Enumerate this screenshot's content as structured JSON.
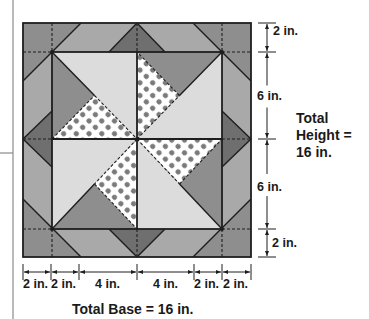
{
  "diagram": {
    "colors": {
      "light": "#dcdcdc",
      "medium": "#a9a9a9",
      "mediumDark": "#8e8e8e",
      "dark": "#6f6f6f",
      "dotBg": "#ffffff",
      "dot": "#7a7a7a",
      "line": "#1e1e1e",
      "text": "#1a1a1a"
    },
    "geometry": {
      "outer": {
        "x0": 23,
        "y0": 23,
        "x1": 251,
        "y1": 257
      },
      "inner": {
        "x0": 52,
        "y0": 52,
        "x1": 222,
        "y1": 229
      },
      "center": {
        "x": 137,
        "y": 139
      }
    },
    "height_dimension": {
      "x": 267,
      "ticks_y": [
        23,
        52,
        139,
        229,
        257
      ],
      "labels": [
        {
          "text": "2 in.",
          "x": 273,
          "y": 31
        },
        {
          "text": "6 in.",
          "x": 257,
          "y": 90
        },
        {
          "text": "6 in.",
          "x": 257,
          "y": 181
        },
        {
          "text": "2 in.",
          "x": 271,
          "y": 240
        }
      ],
      "total_label": [
        "Total",
        "Height =",
        "16 in."
      ]
    },
    "base_dimension": {
      "y": 272,
      "ticks_x": [
        23,
        51,
        79,
        137,
        194,
        222,
        251
      ],
      "labels": [
        {
          "text": "2 in.",
          "x": 23
        },
        {
          "text": "2 in.",
          "x": 51
        },
        {
          "text": "4 in.",
          "x": 95
        },
        {
          "text": "4 in.",
          "x": 153
        },
        {
          "text": "2 in.",
          "x": 194
        },
        {
          "text": "2 in.",
          "x": 223
        }
      ],
      "total_label": "Total Base = 16 in."
    },
    "page_margin": {
      "vertical_x": 13,
      "horizontal_y": 153
    }
  }
}
